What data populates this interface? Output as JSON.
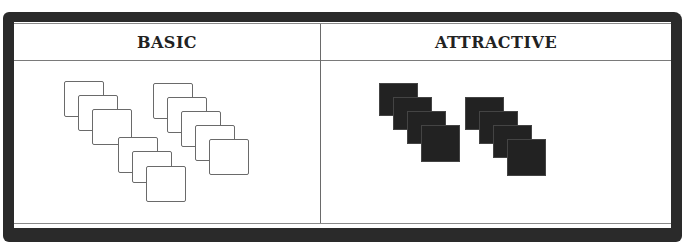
{
  "panels": {
    "left": {
      "title": "BASIC",
      "style": "outlined",
      "fill_color": "#ffffff",
      "stroke_color": "#6a6a6a",
      "groups": [
        {
          "name": "group-1",
          "count": 6
        },
        {
          "name": "group-2",
          "count": 5
        }
      ]
    },
    "right": {
      "title": "ATTRACTIVE",
      "style": "filled",
      "fill_color": "#222222",
      "groups": [
        {
          "name": "group-1",
          "count": 4
        },
        {
          "name": "group-2",
          "count": 4
        }
      ]
    }
  },
  "frame": {
    "border_color": "#2a2a2a",
    "background": "#ffffff"
  }
}
